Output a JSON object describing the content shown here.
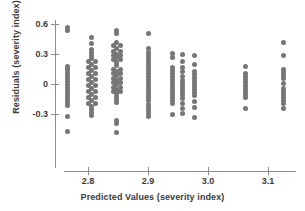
{
  "chart_data": {
    "type": "scatter",
    "title": "",
    "xlabel": "Predicted Values (severity index)",
    "ylabel": "Residuals (severity index)",
    "xlim": [
      2.745,
      3.145
    ],
    "ylim": [
      -0.58,
      0.68
    ],
    "grid": false,
    "legend": null,
    "marker_color": "#767676",
    "marker_size_px": 5,
    "axis_color": "#8e8e8e",
    "xticks": [
      2.8,
      2.9,
      3.0,
      3.1
    ],
    "xtick_labels": [
      "2.8",
      "2.9",
      "3.0",
      "3.1"
    ],
    "yticks": [
      0.6,
      0.3,
      0.0,
      -0.3
    ],
    "ytick_labels": [
      "0.6",
      "0.3",
      "0",
      "-0.3"
    ],
    "series": [
      {
        "name": "residuals",
        "points": [
          [
            2.766,
            0.565
          ],
          [
            2.766,
            0.535
          ],
          [
            2.766,
            0.175
          ],
          [
            2.766,
            0.145
          ],
          [
            2.766,
            0.115
          ],
          [
            2.766,
            0.085
          ],
          [
            2.766,
            0.055
          ],
          [
            2.766,
            0.025
          ],
          [
            2.766,
            -0.005
          ],
          [
            2.766,
            -0.035
          ],
          [
            2.766,
            -0.065
          ],
          [
            2.766,
            -0.095
          ],
          [
            2.766,
            -0.125
          ],
          [
            2.766,
            -0.155
          ],
          [
            2.766,
            -0.185
          ],
          [
            2.766,
            -0.215
          ],
          [
            2.766,
            -0.325
          ],
          [
            2.766,
            -0.475
          ],
          [
            2.806,
            0.47
          ],
          [
            2.806,
            0.405
          ],
          [
            2.806,
            0.35
          ],
          [
            2.806,
            0.32
          ],
          [
            2.806,
            0.29
          ],
          [
            2.806,
            0.255
          ],
          [
            2.812,
            0.225
          ],
          [
            2.8,
            0.225
          ],
          [
            2.806,
            0.195
          ],
          [
            2.8,
            0.165
          ],
          [
            2.812,
            0.165
          ],
          [
            2.806,
            0.135
          ],
          [
            2.8,
            0.105
          ],
          [
            2.812,
            0.105
          ],
          [
            2.806,
            0.075
          ],
          [
            2.8,
            0.045
          ],
          [
            2.812,
            0.045
          ],
          [
            2.806,
            0.015
          ],
          [
            2.8,
            -0.015
          ],
          [
            2.812,
            -0.015
          ],
          [
            2.806,
            -0.045
          ],
          [
            2.8,
            -0.075
          ],
          [
            2.812,
            -0.075
          ],
          [
            2.806,
            -0.105
          ],
          [
            2.8,
            -0.135
          ],
          [
            2.812,
            -0.135
          ],
          [
            2.806,
            -0.165
          ],
          [
            2.8,
            -0.195
          ],
          [
            2.812,
            -0.195
          ],
          [
            2.806,
            -0.225
          ],
          [
            2.806,
            -0.255
          ],
          [
            2.806,
            -0.285
          ],
          [
            2.806,
            -0.315
          ],
          [
            2.848,
            0.54
          ],
          [
            2.848,
            0.505
          ],
          [
            2.848,
            0.42
          ],
          [
            2.842,
            0.39
          ],
          [
            2.854,
            0.39
          ],
          [
            2.848,
            0.36
          ],
          [
            2.842,
            0.33
          ],
          [
            2.854,
            0.33
          ],
          [
            2.848,
            0.3
          ],
          [
            2.842,
            0.285
          ],
          [
            2.854,
            0.285
          ],
          [
            2.848,
            0.265
          ],
          [
            2.842,
            0.245
          ],
          [
            2.854,
            0.245
          ],
          [
            2.848,
            0.215
          ],
          [
            2.848,
            0.185
          ],
          [
            2.842,
            0.15
          ],
          [
            2.854,
            0.15
          ],
          [
            2.848,
            0.13
          ],
          [
            2.842,
            0.105
          ],
          [
            2.854,
            0.105
          ],
          [
            2.848,
            0.085
          ],
          [
            2.842,
            0.06
          ],
          [
            2.854,
            0.06
          ],
          [
            2.848,
            0.04
          ],
          [
            2.842,
            0.015
          ],
          [
            2.854,
            0.015
          ],
          [
            2.848,
            -0.005
          ],
          [
            2.842,
            -0.03
          ],
          [
            2.854,
            -0.03
          ],
          [
            2.848,
            -0.05
          ],
          [
            2.842,
            -0.075
          ],
          [
            2.854,
            -0.075
          ],
          [
            2.848,
            -0.095
          ],
          [
            2.848,
            -0.125
          ],
          [
            2.848,
            -0.155
          ],
          [
            2.848,
            -0.185
          ],
          [
            2.848,
            -0.36
          ],
          [
            2.848,
            -0.395
          ],
          [
            2.848,
            -0.48
          ],
          [
            2.9,
            0.51
          ],
          [
            2.9,
            0.355
          ],
          [
            2.9,
            0.32
          ],
          [
            2.9,
            0.29
          ],
          [
            2.9,
            0.255
          ],
          [
            2.9,
            0.225
          ],
          [
            2.9,
            0.195
          ],
          [
            2.9,
            0.165
          ],
          [
            2.9,
            0.135
          ],
          [
            2.9,
            0.105
          ],
          [
            2.9,
            0.075
          ],
          [
            2.9,
            0.045
          ],
          [
            2.9,
            0.015
          ],
          [
            2.9,
            -0.015
          ],
          [
            2.9,
            -0.045
          ],
          [
            2.9,
            -0.075
          ],
          [
            2.9,
            -0.105
          ],
          [
            2.9,
            -0.135
          ],
          [
            2.9,
            -0.165
          ],
          [
            2.9,
            -0.2
          ],
          [
            2.9,
            -0.23
          ],
          [
            2.9,
            -0.26
          ],
          [
            2.9,
            -0.29
          ],
          [
            2.9,
            -0.32
          ],
          [
            2.94,
            0.305
          ],
          [
            2.94,
            0.27
          ],
          [
            2.94,
            0.165
          ],
          [
            2.94,
            0.135
          ],
          [
            2.94,
            0.105
          ],
          [
            2.94,
            0.075
          ],
          [
            2.94,
            0.045
          ],
          [
            2.94,
            0.015
          ],
          [
            2.94,
            -0.015
          ],
          [
            2.94,
            -0.045
          ],
          [
            2.94,
            -0.075
          ],
          [
            2.94,
            -0.105
          ],
          [
            2.94,
            -0.135
          ],
          [
            2.94,
            -0.165
          ],
          [
            2.94,
            -0.195
          ],
          [
            2.94,
            -0.3
          ],
          [
            2.957,
            0.3
          ],
          [
            2.957,
            0.225
          ],
          [
            2.957,
            0.165
          ],
          [
            2.957,
            0.125
          ],
          [
            2.957,
            0.075
          ],
          [
            2.957,
            0.04
          ],
          [
            2.957,
            0.01
          ],
          [
            2.957,
            -0.02
          ],
          [
            2.957,
            -0.05
          ],
          [
            2.957,
            -0.08
          ],
          [
            2.957,
            -0.11
          ],
          [
            2.957,
            -0.14
          ],
          [
            2.957,
            -0.195
          ],
          [
            2.957,
            -0.24
          ],
          [
            2.957,
            -0.29
          ],
          [
            2.977,
            0.285
          ],
          [
            2.977,
            0.195
          ],
          [
            2.977,
            0.13
          ],
          [
            2.977,
            0.1
          ],
          [
            2.977,
            0.07
          ],
          [
            2.977,
            0.04
          ],
          [
            2.977,
            0.01
          ],
          [
            2.977,
            -0.02
          ],
          [
            2.977,
            -0.05
          ],
          [
            2.977,
            -0.08
          ],
          [
            2.977,
            -0.11
          ],
          [
            2.977,
            -0.17
          ],
          [
            2.977,
            -0.235
          ],
          [
            2.977,
            -0.33
          ],
          [
            3.063,
            0.18
          ],
          [
            3.063,
            0.105
          ],
          [
            3.063,
            0.075
          ],
          [
            3.063,
            0.045
          ],
          [
            3.063,
            0.015
          ],
          [
            3.063,
            -0.015
          ],
          [
            3.063,
            -0.045
          ],
          [
            3.063,
            -0.075
          ],
          [
            3.063,
            -0.105
          ],
          [
            3.063,
            -0.135
          ],
          [
            3.063,
            -0.24
          ],
          [
            3.125,
            0.42
          ],
          [
            3.125,
            0.285
          ],
          [
            3.125,
            0.15
          ],
          [
            3.125,
            0.12
          ],
          [
            3.125,
            0.09
          ],
          [
            3.125,
            0.06
          ],
          [
            3.125,
            0.01
          ],
          [
            3.125,
            -0.04
          ],
          [
            3.125,
            -0.07
          ],
          [
            3.125,
            -0.1
          ],
          [
            3.125,
            -0.13
          ],
          [
            3.125,
            -0.16
          ],
          [
            3.125,
            -0.19
          ],
          [
            3.125,
            -0.24
          ]
        ]
      }
    ]
  }
}
